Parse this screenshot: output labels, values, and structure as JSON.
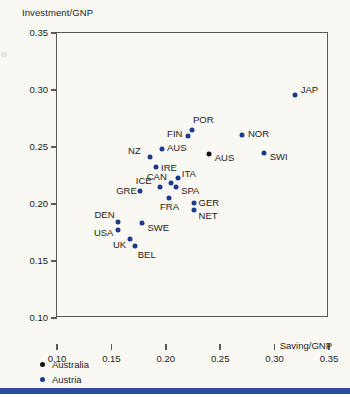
{
  "chart_data": {
    "type": "scatter",
    "title": "Investment/GNP",
    "xlabel": "Saving/GNP",
    "ylabel": "Investment/GNP",
    "xlim": [
      0.1,
      0.35
    ],
    "ylim": [
      0.1,
      0.35
    ],
    "xticks": [
      "0.10",
      "0.15",
      "0.20",
      "0.25",
      "0.30",
      "0.35"
    ],
    "xtick_values": [
      0.1,
      0.15,
      0.2,
      0.25,
      0.3,
      0.35
    ],
    "yticks": [
      "0.10",
      "0.15",
      "0.20",
      "0.25",
      "0.30",
      "0.35"
    ],
    "ytick_values": [
      0.1,
      0.15,
      0.2,
      0.25,
      0.3,
      0.35
    ],
    "grid": false,
    "legend_position": "below-axes-left",
    "series": [
      {
        "name": "Australia",
        "color": "#121212",
        "points": [
          {
            "label": "AUS",
            "x": 0.2395,
            "y": 0.2435,
            "label_dx": 6,
            "label_dy": 4
          }
        ]
      },
      {
        "name": "Austria",
        "color": "#1c3a8c",
        "points": [
          {
            "label": "JAP",
            "x": 0.3185,
            "y": 0.2955,
            "label_dx": 6,
            "label_dy": -5
          },
          {
            "label": "POR",
            "x": 0.224,
            "y": 0.265,
            "label_dx": 1,
            "label_dy": -10
          },
          {
            "label": "FIN",
            "x": 0.2205,
            "y": 0.26,
            "label_dx": -21,
            "label_dy": -2
          },
          {
            "label": "NOR",
            "x": 0.27,
            "y": 0.2605,
            "label_dx": 6,
            "label_dy": -1
          },
          {
            "label": "SWI",
            "x": 0.29,
            "y": 0.245,
            "label_dx": 6,
            "label_dy": 4
          },
          {
            "label": "AUS",
            "x": 0.1965,
            "y": 0.2485,
            "label_dx": 5,
            "label_dy": -1
          },
          {
            "label": "NZ",
            "x": 0.1855,
            "y": 0.2415,
            "label_dx": -22,
            "label_dy": -6
          },
          {
            "label": "IRE",
            "x": 0.191,
            "y": 0.2325,
            "label_dx": 5,
            "label_dy": 1
          },
          {
            "label": "ITA",
            "x": 0.211,
            "y": 0.223,
            "label_dx": 4,
            "label_dy": -4
          },
          {
            "label": "CAN",
            "x": 0.2045,
            "y": 0.2185,
            "label_dx": -24,
            "label_dy": -6
          },
          {
            "label": "ICE",
            "x": 0.1945,
            "y": 0.2145,
            "label_dx": -24,
            "label_dy": -6
          },
          {
            "label": "SPA",
            "x": 0.2095,
            "y": 0.2145,
            "label_dx": 5,
            "label_dy": 4
          },
          {
            "label": "GRE",
            "x": 0.1765,
            "y": 0.211,
            "label_dx": -24,
            "label_dy": 0
          },
          {
            "label": "FRA",
            "x": 0.203,
            "y": 0.2055,
            "label_dx": -9,
            "label_dy": 9
          },
          {
            "label": "GER",
            "x": 0.2255,
            "y": 0.2005,
            "label_dx": 5,
            "label_dy": 0
          },
          {
            "label": "NET",
            "x": 0.2255,
            "y": 0.195,
            "label_dx": 5,
            "label_dy": 6
          },
          {
            "label": "DEN",
            "x": 0.1565,
            "y": 0.184,
            "label_dx": -24,
            "label_dy": -7
          },
          {
            "label": "SWE",
            "x": 0.1785,
            "y": 0.1835,
            "label_dx": 5,
            "label_dy": 5
          },
          {
            "label": "USA",
            "x": 0.156,
            "y": 0.1775,
            "label_dx": -24,
            "label_dy": 3
          },
          {
            "label": "UK",
            "x": 0.167,
            "y": 0.169,
            "label_dx": -17,
            "label_dy": 6
          },
          {
            "label": "BEL",
            "x": 0.1715,
            "y": 0.1635,
            "label_dx": 3,
            "label_dy": 9
          }
        ]
      }
    ]
  },
  "legend": {
    "items": [
      {
        "label": "Australia",
        "color": "#121212"
      },
      {
        "label": "Austria",
        "color": "#1c3a8c"
      }
    ]
  },
  "colors": {
    "austria_blue": "#1c3a8c",
    "australia_black": "#121212",
    "frame": "#5a5a5a",
    "background": "#faf8f2",
    "bottom_bar": "#2f4f9a"
  }
}
